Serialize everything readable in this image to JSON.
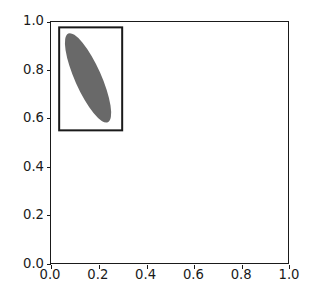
{
  "figure": {
    "width_px": 311,
    "height_px": 304,
    "background_color": "#ffffff",
    "title": ""
  },
  "axes": {
    "left_px": 50,
    "top_px": 21,
    "width_px": 239,
    "height_px": 243,
    "spine_color": "#1a1a1a",
    "facecolor": "#ffffff",
    "grid": false,
    "legend": null
  },
  "chart_data": {
    "type": "scatter",
    "title": "",
    "xlabel": "",
    "ylabel": "",
    "xlim": [
      0.0,
      1.0
    ],
    "ylim": [
      0.0,
      1.0
    ],
    "grid": false,
    "legend_position": "none",
    "xticks": [
      0.0,
      0.2,
      0.4,
      0.6,
      0.8,
      1.0
    ],
    "yticks": [
      0.0,
      0.2,
      0.4,
      0.6,
      0.8,
      1.0
    ],
    "xticklabels": [
      "0.0",
      "0.2",
      "0.4",
      "0.6",
      "0.8",
      "1.0"
    ],
    "yticklabels": [
      "0.0",
      "0.2",
      "0.4",
      "0.6",
      "0.8",
      "1.0"
    ],
    "patches": [
      {
        "name": "ellipse",
        "shape": "ellipse",
        "center": [
          0.155,
          0.77
        ],
        "width": 0.11,
        "height": 0.4,
        "angle_deg": -24,
        "facecolor": "#696969",
        "edgecolor": "none",
        "linewidth": 0,
        "alpha": 1.0
      },
      {
        "name": "bounding-box",
        "shape": "rectangle",
        "xy": [
          0.03,
          0.55
        ],
        "width": 0.272,
        "height": 0.432,
        "facecolor": "none",
        "edgecolor": "#1a1a1a",
        "linewidth": 2.0
      }
    ]
  }
}
